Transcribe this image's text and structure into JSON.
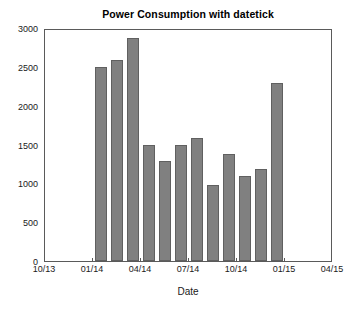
{
  "chart_data": {
    "type": "bar",
    "title": "Power Consumption with datetick",
    "xlabel": "Date",
    "ylabel": "",
    "grid": false,
    "legend": null,
    "bar_color": "#808080",
    "bar_edge_color": "#606060",
    "axis_color": "#5a5a5a",
    "background": "#ffffff",
    "ylim": [
      0,
      3000
    ],
    "yticks": [
      0,
      500,
      1000,
      1500,
      2000,
      2500,
      3000
    ],
    "ytick_labels": [
      "0",
      "500",
      "1000",
      "1500",
      "2000",
      "2500",
      "3000"
    ],
    "xlim_labels": [
      "10/13",
      "04/15"
    ],
    "xticks": [
      0,
      1,
      2,
      3,
      4,
      5,
      6
    ],
    "xtick_labels": [
      "10/13",
      "01/14",
      "04/14",
      "07/14",
      "10/14",
      "01/15",
      "04/15"
    ],
    "x": [
      "01/14",
      "02/14",
      "03/14",
      "04/14",
      "05/14",
      "06/14",
      "07/14",
      "08/14",
      "09/14",
      "10/14",
      "11/14",
      "12/14"
    ],
    "categories": [
      "01/14",
      "02/14",
      "03/14",
      "04/14",
      "05/14",
      "06/14",
      "07/14",
      "08/14",
      "09/14",
      "10/14",
      "11/14",
      "12/14"
    ],
    "values": [
      2495,
      2585,
      2875,
      1490,
      1285,
      1490,
      1580,
      985,
      1375,
      1090,
      1180,
      2290
    ]
  }
}
